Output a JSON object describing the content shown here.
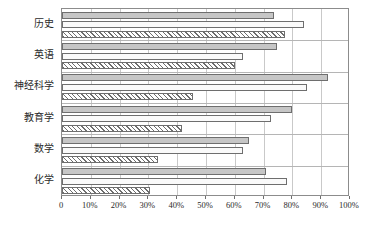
{
  "chart_data": {
    "type": "bar",
    "orientation": "horizontal",
    "title": "",
    "xlabel": "",
    "ylabel": "",
    "categories": [
      "历史",
      "英语",
      "神经科学",
      "教育学",
      "数学",
      "化学"
    ],
    "series": [
      {
        "name": "series-1",
        "style": "gray-fill",
        "color": "#c6c6c6",
        "values": [
          73.5,
          74.5,
          92.5,
          80.0,
          65.0,
          71.0
        ]
      },
      {
        "name": "series-2",
        "style": "white-fill",
        "color": "#fafafa",
        "values": [
          84.0,
          63.0,
          85.0,
          72.5,
          63.0,
          78.0
        ]
      },
      {
        "name": "series-3",
        "style": "hatched",
        "color": "#ffffff",
        "values": [
          77.5,
          60.0,
          45.5,
          41.5,
          33.5,
          30.5
        ]
      }
    ],
    "xlim": [
      0,
      100
    ],
    "xticks": [
      0,
      10,
      20,
      30,
      40,
      50,
      60,
      70,
      80,
      90,
      100
    ],
    "xticklabels": [
      "0",
      "10%",
      "20%",
      "30%",
      "40%",
      "50%",
      "60%",
      "70%",
      "80%",
      "90%",
      "100%"
    ],
    "grid": "vertical",
    "legend": "none"
  }
}
